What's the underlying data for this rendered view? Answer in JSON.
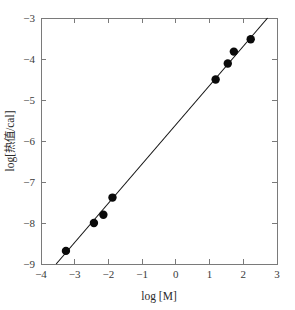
{
  "chart_data": {
    "type": "scatter",
    "title": "",
    "subtitle": "",
    "xlabel": "log [M]",
    "ylabel": "log[热值/cal]",
    "xlim": [
      -4,
      3
    ],
    "ylim": [
      -9,
      -3
    ],
    "xticks": [
      -4,
      -3,
      -2,
      -1,
      0,
      1,
      2,
      3
    ],
    "xtick_labels": [
      "−4",
      "−3",
      "−2",
      "−1",
      "0",
      "1",
      "2",
      "3"
    ],
    "yticks": [
      -9,
      -8,
      -7,
      -6,
      -5,
      -4,
      -3
    ],
    "ytick_labels": [
      "−9",
      "−8",
      "−7",
      "−6",
      "−5",
      "−4",
      "−3"
    ],
    "grid": false,
    "legend": null,
    "legend_position": "none",
    "marker": "filled-circle",
    "marker_color": "#0a0a0a",
    "line_color": "#111111",
    "axis_color": "#7a7a7a",
    "x": [
      -3.26,
      -2.43,
      -2.15,
      -1.88,
      1.18,
      1.54,
      1.72,
      2.22
    ],
    "y": [
      -8.68,
      -8.0,
      -7.8,
      -7.38,
      -4.5,
      -4.11,
      -3.82,
      -3.52
    ],
    "points": [
      {
        "x": -3.26,
        "y": -8.68
      },
      {
        "x": -2.43,
        "y": -8.0
      },
      {
        "x": -2.15,
        "y": -7.8
      },
      {
        "x": -1.88,
        "y": -7.38
      },
      {
        "x": 1.18,
        "y": -4.5
      },
      {
        "x": 1.54,
        "y": -4.11
      },
      {
        "x": 1.72,
        "y": -3.82
      },
      {
        "x": 2.22,
        "y": -3.52
      }
    ],
    "fit_line": {
      "type": "line",
      "x_start": -3.55,
      "y_start": -9.0,
      "x_end": 2.72,
      "y_end": -3.0
    }
  }
}
